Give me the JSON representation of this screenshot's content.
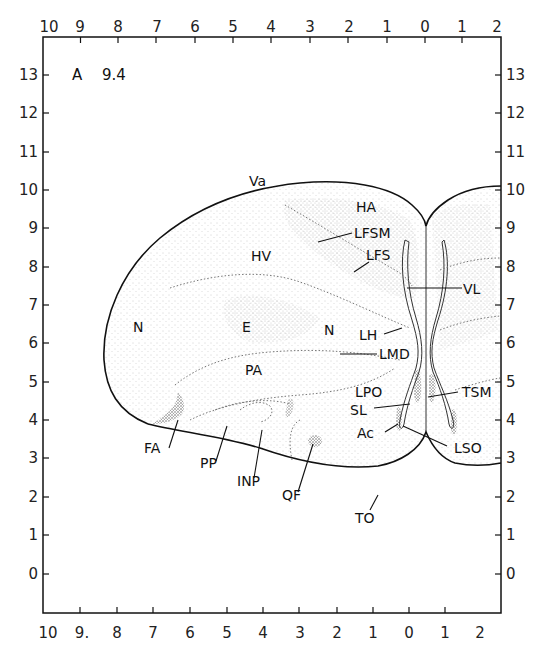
{
  "figure": {
    "plate_prefix": "A",
    "plate_number": "9.4"
  },
  "axes": {
    "top": [
      "10",
      "9",
      "8",
      "7",
      "6",
      "5",
      "4",
      "3",
      "2",
      "1",
      "0",
      "1",
      "2"
    ],
    "bottom": [
      "10",
      "9.",
      "8",
      "7",
      "6",
      "5",
      "4",
      "3",
      "2",
      "1",
      "0",
      "1",
      "2"
    ],
    "left": [
      "13",
      "12",
      "11",
      "10",
      "9",
      "8",
      "7",
      "6",
      "5",
      "4",
      "3",
      "2",
      "1",
      "0"
    ],
    "right": [
      "13",
      "12",
      "11",
      "10",
      "9",
      "8",
      "7",
      "6",
      "5",
      "4",
      "3",
      "2",
      "1",
      "0"
    ]
  },
  "regions": {
    "Va": "Va",
    "HA": "HA",
    "LFSM": "LFSM",
    "HV": "HV",
    "LFS": "LFS",
    "VL": "VL",
    "N_left": "N",
    "E": "E",
    "N_mid": "N",
    "LH": "LH",
    "LMD": "LMD",
    "PA": "PA",
    "LPO": "LPO",
    "TSM": "TSM",
    "SL": "SL",
    "Ac": "Ac",
    "LSO": "LSO",
    "FA": "FA",
    "PP": "PP",
    "INP": "INP",
    "QF": "QF",
    "TO": "TO"
  }
}
